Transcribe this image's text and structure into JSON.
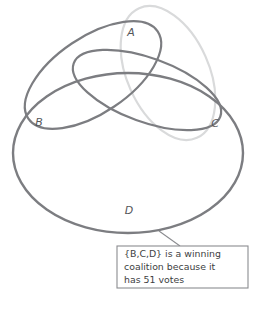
{
  "figure": {
    "background_color": "#ffffff",
    "width": 257,
    "height": 310
  },
  "colors": {
    "stroke_dark": "#7c7d81",
    "stroke_light": "#d9dadb",
    "label_text": "#55565a",
    "callout_border": "#8b8c90",
    "callout_text": "#3d3e42",
    "callout_fill": "#ffffff",
    "leader_line": "#8b8c90"
  },
  "sets": [
    {
      "id": "A",
      "label": "A",
      "color": "#d9dadb",
      "label_x": 131,
      "label_y": 33
    },
    {
      "id": "B",
      "label": "B",
      "color": "#7c7d81",
      "label_x": 39,
      "label_y": 123
    },
    {
      "id": "C",
      "label": "C",
      "color": "#7c7d81",
      "label_x": 215,
      "label_y": 124
    },
    {
      "id": "D",
      "label": "D",
      "color": "#7c7d81",
      "label_x": 129,
      "label_y": 211
    }
  ],
  "callout": {
    "lines": [
      "{B,C,D} is a winning",
      "coalition because it",
      "has 51 votes"
    ],
    "full_text": "{B,C,D} is a winning coalition because it has 51 votes",
    "coalition": "{B,C,D}",
    "votes": "51",
    "box": {
      "x": 117,
      "y": 246,
      "width": 131,
      "height": 42
    }
  },
  "top_clipped_text": ""
}
